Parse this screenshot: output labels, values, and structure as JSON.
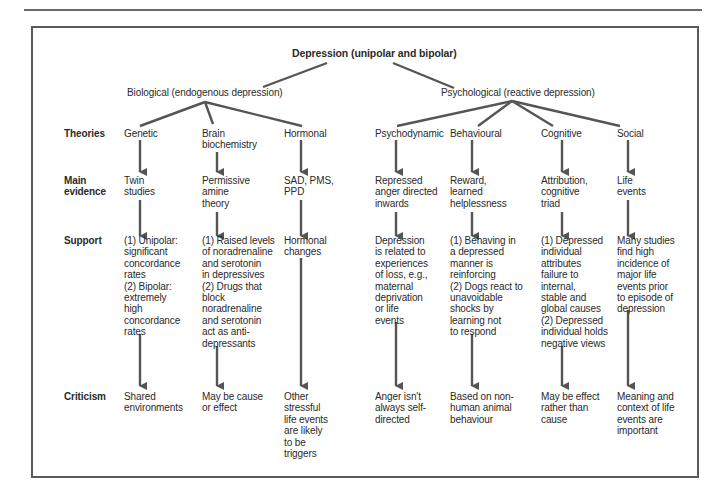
{
  "diagram": {
    "title": "Depression (unipolar and bipolar)",
    "branches": [
      {
        "label": "Biological (endogenous depression)"
      },
      {
        "label": "Psychological (reactive depression)"
      }
    ],
    "row_labels": {
      "theories": "Theories",
      "main_evidence": "Main\nevidence",
      "support": "Support",
      "criticism": "Criticism"
    },
    "columns": [
      {
        "branch": "Biological",
        "theory": "Genetic",
        "evidence": "Twin\nstudies",
        "support": "(1) Unipolar:\nsignificant\nconcordance\nrates\n(2) Bipolar:\nextremely\nhigh\nconcordance\nrates",
        "criticism": "Shared\nenvironments"
      },
      {
        "branch": "Biological",
        "theory": "Brain\nbiochemistry",
        "evidence": "Permissive\namine\ntheory",
        "support": "(1) Raised levels\nof noradrenaline\nand serotonin\nin depressives\n(2) Drugs that\nblock\nnoradrenaline\nand serotonin\nact as anti-\ndepressants",
        "criticism": "May be cause\nor effect"
      },
      {
        "branch": "Biological",
        "theory": "Hormonal",
        "evidence": "SAD, PMS,\nPPD",
        "support": "Hormonal\nchanges",
        "criticism": "Other\nstressful\nlife events\nare likely\nto be\ntriggers"
      },
      {
        "branch": "Psychological",
        "theory": "Psychodynamic",
        "evidence": "Repressed\nanger directed\ninwards",
        "support": "Depression\nis related to\nexperiences\nof loss, e.g.,\nmaternal\ndeprivation\nor life\nevents",
        "criticism": "Anger isn't\nalways self-\ndirected"
      },
      {
        "branch": "Psychological",
        "theory": "Behavioural",
        "evidence": "Reward,\nlearned\nhelplessness",
        "support": "(1) Behaving in\na depressed\nmanner is\nreinforcing\n(2) Dogs react to\nunavoidable\nshocks by\nlearning not\nto respond",
        "criticism": "Based on non-\nhuman animal\nbehaviour"
      },
      {
        "branch": "Psychological",
        "theory": "Cognitive",
        "evidence": "Attribution,\ncognitive\ntriad",
        "support": "(1) Depressed\nindividual\nattributes\nfailure to\ninternal,\nstable and\nglobal causes\n(2) Depressed\nindividual holds\nnegative views",
        "criticism": "May be effect\nrather than\ncause"
      },
      {
        "branch": "Psychological",
        "theory": "Social",
        "evidence": "Life\nevents",
        "support": "Many studies\nfind high\nincidence of\nmajor life\nevents prior\nto episode of\ndepression",
        "criticism": "Meaning and\ncontext of life\nevents are\nimportant"
      }
    ],
    "colors": {
      "line": "#555555",
      "text": "#2a2a2a",
      "frame": "#5a5a5a"
    }
  }
}
